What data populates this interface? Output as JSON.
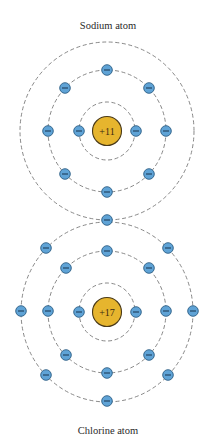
{
  "atoms": [
    {
      "name": "sodium",
      "title": "Sodium atom",
      "nucleus_charge": "+11",
      "center": [
        107,
        131
      ],
      "label_pos": [
        108,
        29
      ],
      "rings": [
        {
          "rx": 28,
          "ry": 29
        },
        {
          "rx": 59,
          "ry": 61
        },
        {
          "rx": 87,
          "ry": 89
        }
      ],
      "electrons": [
        [
          79,
          131
        ],
        [
          136,
          131
        ],
        [
          107,
          70
        ],
        [
          65,
          88
        ],
        [
          149,
          88
        ],
        [
          48,
          131
        ],
        [
          166,
          131
        ],
        [
          65,
          174
        ],
        [
          149,
          174
        ],
        [
          107,
          192
        ],
        [
          107,
          220
        ]
      ]
    },
    {
      "name": "chlorine",
      "title": "Chlorine atom",
      "nucleus_charge": "+17",
      "center": [
        107,
        312
      ],
      "label_pos": [
        108,
        434
      ],
      "rings": [
        {
          "rx": 28,
          "ry": 29
        },
        {
          "rx": 59,
          "ry": 61
        },
        {
          "rx": 86,
          "ry": 90
        }
      ],
      "electrons": [
        [
          79,
          312
        ],
        [
          136,
          312
        ],
        [
          107,
          251
        ],
        [
          66,
          268
        ],
        [
          149,
          268
        ],
        [
          48,
          311
        ],
        [
          166,
          311
        ],
        [
          66,
          355
        ],
        [
          149,
          355
        ],
        [
          107,
          373
        ],
        [
          46,
          248
        ],
        [
          168,
          248
        ],
        [
          21,
          311
        ],
        [
          193,
          311
        ],
        [
          46,
          375
        ],
        [
          168,
          375
        ],
        [
          107,
          401
        ]
      ]
    }
  ],
  "electron_symbol": "minus-sign",
  "colors": {
    "nucleus": "#e6b52e",
    "electron": "#5fa3d6",
    "ring": "#7a7a7a"
  }
}
